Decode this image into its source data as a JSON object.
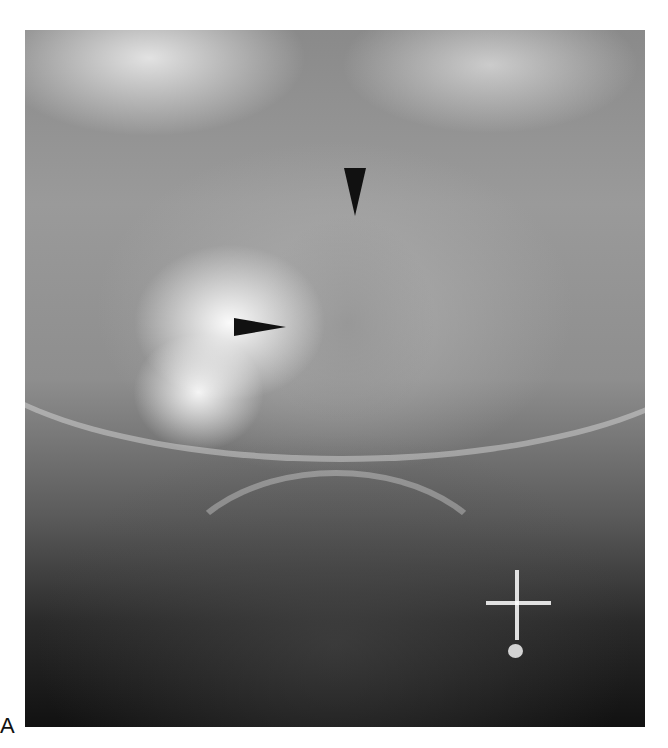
{
  "figure": {
    "panel_label": "A",
    "image_description": "Radiograph (skull / sinus region) with two black arrowheads pointing to a multiloculated lesion, and a white crosshair marker with dot at lower right",
    "annotations": [
      {
        "type": "arrowhead",
        "direction": "down",
        "color": "#111111"
      },
      {
        "type": "arrowhead",
        "direction": "right",
        "color": "#111111"
      },
      {
        "type": "crosshair-marker",
        "color": "#ffffff"
      }
    ]
  }
}
